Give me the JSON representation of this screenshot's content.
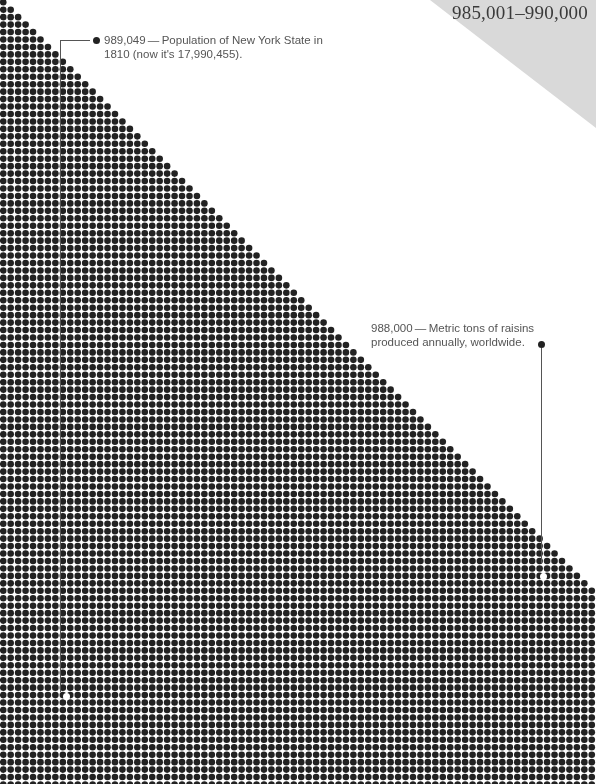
{
  "chart_data": {
    "type": "dot-matrix",
    "title": "985,001–990,000",
    "range_start": 985001,
    "range_end": 990000,
    "grid": {
      "columns": 80,
      "rows": 106,
      "pitch_px": 7.45,
      "dot_radius_px": 3.3,
      "fill_rule": "row r contains min(r+1, columns) dots from the left"
    },
    "annotations": [
      {
        "value": 989049,
        "value_label": "989,049",
        "text": "Population of New York State in 1810 (now it's 17,990,455).",
        "marker_px": [
          66,
          697
        ]
      },
      {
        "value": 988000,
        "value_label": "988,000",
        "text": "Metric tons of raisins produced annually, worldwide.",
        "marker_px": [
          543,
          577
        ]
      }
    ],
    "colors": {
      "dot": "#222222",
      "background": "#ffffff",
      "corner_triangle": "#d9d9d9",
      "leader_line": "#555555"
    }
  },
  "header": {
    "range_label": "985,001–990,000"
  },
  "annotations": {
    "nys": {
      "line1": "989,049 — Population of New York State in",
      "line2": "1810 (now it's 17,990,455)."
    },
    "raisins": {
      "line1": "988,000 — Metric tons of raisins",
      "line2": "produced annually, worldwide."
    }
  }
}
